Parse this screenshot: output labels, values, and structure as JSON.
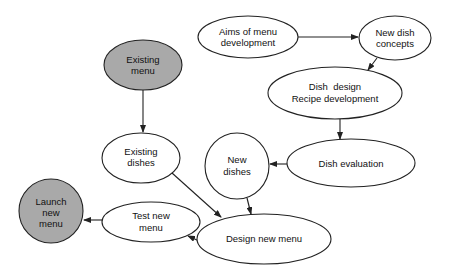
{
  "diagram": {
    "type": "flowchart",
    "colors": {
      "highlight_fill": "#a9a9a9",
      "normal_fill": "#ffffff",
      "stroke": "#222222"
    },
    "nodes": [
      {
        "id": "existing_menu",
        "lines": [
          "Existing",
          "menu"
        ],
        "highlighted": true
      },
      {
        "id": "aims",
        "lines": [
          "Aims of menu",
          "development"
        ],
        "highlighted": false
      },
      {
        "id": "new_concepts",
        "lines": [
          "New dish",
          "concepts"
        ],
        "highlighted": false
      },
      {
        "id": "dish_design",
        "lines": [
          "Dish  design",
          "Recipe development"
        ],
        "highlighted": false
      },
      {
        "id": "existing_dishes",
        "lines": [
          "Existing",
          "dishes"
        ],
        "highlighted": false
      },
      {
        "id": "new_dishes",
        "lines": [
          "New",
          "dishes"
        ],
        "highlighted": false
      },
      {
        "id": "dish_evaluation",
        "lines": [
          "Dish evaluation"
        ],
        "highlighted": false
      },
      {
        "id": "launch",
        "lines": [
          "Launch",
          "new",
          "menu"
        ],
        "highlighted": true
      },
      {
        "id": "test_menu",
        "lines": [
          "Test new",
          "menu"
        ],
        "highlighted": false
      },
      {
        "id": "design_menu",
        "lines": [
          "Design new menu"
        ],
        "highlighted": false
      }
    ],
    "edges": [
      {
        "from": "existing_menu",
        "to": "existing_dishes"
      },
      {
        "from": "aims",
        "to": "new_concepts"
      },
      {
        "from": "new_concepts",
        "to": "dish_design"
      },
      {
        "from": "dish_design",
        "to": "dish_evaluation"
      },
      {
        "from": "dish_evaluation",
        "to": "new_dishes"
      },
      {
        "from": "new_dishes",
        "to": "design_menu"
      },
      {
        "from": "existing_dishes",
        "to": "design_menu"
      },
      {
        "from": "design_menu",
        "to": "test_menu"
      },
      {
        "from": "test_menu",
        "to": "launch"
      }
    ]
  }
}
